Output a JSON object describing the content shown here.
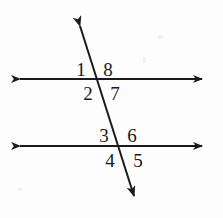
{
  "figure": {
    "background_color": "#fdfdfd",
    "stroke_color": "#1a1a1a",
    "label_color": "#1a1a1a",
    "line_width": 2,
    "lines": [
      {
        "name": "top-parallel-line",
        "kind": "horizontal",
        "x1": 10,
        "y1": 79,
        "x2": 212,
        "y2": 79,
        "arrow_start": true,
        "arrow_end": true
      },
      {
        "name": "bottom-parallel-line",
        "kind": "horizontal",
        "x1": 10,
        "y1": 146,
        "x2": 212,
        "y2": 146,
        "arrow_start": true,
        "arrow_end": true
      },
      {
        "name": "transversal-line",
        "kind": "transversal",
        "x1": 77,
        "y1": 16,
        "x2": 137,
        "y2": 206,
        "arrow_start": true,
        "arrow_end": true
      }
    ],
    "intersections": [
      {
        "name": "top-intersection",
        "x": 96,
        "y": 79
      },
      {
        "name": "bottom-intersection",
        "x": 117,
        "y": 146
      }
    ],
    "angle_labels": [
      {
        "id": "angle-1",
        "text": "1",
        "x": 72,
        "y": 60,
        "position": "top-left-of-top-intersection"
      },
      {
        "id": "angle-8",
        "text": "8",
        "x": 99,
        "y": 60,
        "position": "top-right-of-top-intersection"
      },
      {
        "id": "angle-2",
        "text": "2",
        "x": 79,
        "y": 84,
        "position": "bottom-left-of-top-intersection"
      },
      {
        "id": "angle-7",
        "text": "7",
        "x": 106,
        "y": 84,
        "position": "bottom-right-of-top-intersection"
      },
      {
        "id": "angle-3",
        "text": "3",
        "x": 95,
        "y": 126,
        "position": "top-left-of-bottom-intersection"
      },
      {
        "id": "angle-6",
        "text": "6",
        "x": 123,
        "y": 126,
        "position": "top-right-of-bottom-intersection"
      },
      {
        "id": "angle-4",
        "text": "4",
        "x": 101,
        "y": 151,
        "position": "bottom-left-of-bottom-intersection"
      },
      {
        "id": "angle-5",
        "text": "5",
        "x": 129,
        "y": 151,
        "position": "bottom-right-of-bottom-intersection"
      }
    ]
  }
}
